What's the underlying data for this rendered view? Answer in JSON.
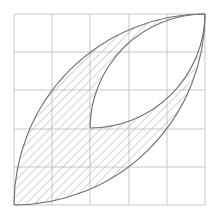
{
  "diagram": {
    "grid": {
      "cols": 5,
      "rows": 5,
      "origin_x": 14,
      "origin_y": 14,
      "cell": 38.2,
      "line_color": "#c8c8c8"
    },
    "shape": {
      "outline_color": "#6f6f6f",
      "hatch_color": "#9a9a9a",
      "fill_color": "#ffffff"
    }
  }
}
